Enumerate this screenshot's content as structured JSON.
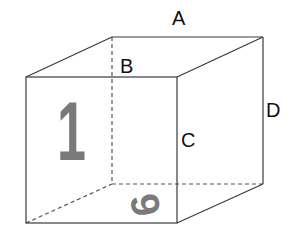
{
  "diagram": {
    "colors": {
      "edge": "#3a3a3a",
      "hidden_edge": "#555555",
      "face_number": "#7a7a7a",
      "label": "#111111",
      "background": "#ffffff"
    },
    "vertices": {
      "front_top_left": [
        26,
        77
      ],
      "front_top_right": [
        177,
        77
      ],
      "front_bottom_left": [
        26,
        223
      ],
      "front_bottom_right": [
        177,
        223
      ],
      "back_top_left": [
        112,
        37
      ],
      "back_top_right": [
        263,
        37
      ],
      "back_bottom_left": [
        112,
        184
      ],
      "back_bottom_right": [
        263,
        184
      ]
    },
    "labels": {
      "A": "A",
      "B": "B",
      "C": "C",
      "D": "D"
    },
    "faces": {
      "front_number": "1",
      "bottom_number": "6"
    }
  }
}
